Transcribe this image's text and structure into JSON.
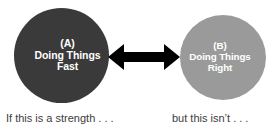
{
  "diagram": {
    "type": "two-node-tradeoff",
    "nodes": [
      {
        "id": "A",
        "tag": "(A)",
        "line1": "Doing Things",
        "line2": "Fast",
        "fill": "#3a3a3a",
        "text_color": "#ffffff"
      },
      {
        "id": "B",
        "tag": "(B)",
        "line1": "Doing Things",
        "line2": "Right",
        "fill": "#9a9a9a",
        "text_color": "#ffffff"
      }
    ],
    "connector": {
      "name": "double-headed-arrow",
      "color": "#000000"
    },
    "captions": {
      "left": "If this is a strength . . .",
      "right": "but this isn’t . . ."
    },
    "background": "#ffffff"
  }
}
